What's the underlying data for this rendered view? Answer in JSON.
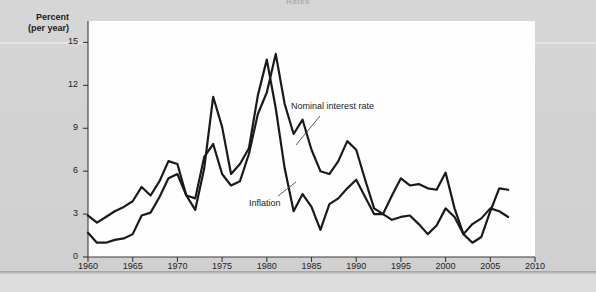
{
  "figure": {
    "top_title": "Rates",
    "axis_title_line1": "Percent",
    "axis_title_line2": "(per year)"
  },
  "axes": {
    "y_ticks": [
      "0",
      "3",
      "6",
      "9",
      "12",
      "15"
    ],
    "x_ticks": [
      "1960",
      "1965",
      "1970",
      "1975",
      "1980",
      "1985",
      "1990",
      "1995",
      "2000",
      "2005",
      "2010"
    ]
  },
  "annotations": {
    "nominal_label": "Nominal interest rate",
    "inflation_label": "Inflation"
  },
  "colors": {
    "line": "#1a1a1a",
    "plot_background": "#fefefe",
    "page_background": "#d4d4d4",
    "text": "#222222"
  },
  "chart_data": {
    "type": "line",
    "title": "Rates",
    "xlabel": "",
    "ylabel": "Percent (per year)",
    "xlim": [
      1960,
      2010
    ],
    "ylim": [
      0,
      16.5
    ],
    "grid": false,
    "legend": "annotated-inline",
    "x": [
      1960,
      1961,
      1962,
      1963,
      1964,
      1965,
      1966,
      1967,
      1968,
      1969,
      1970,
      1971,
      1972,
      1973,
      1974,
      1975,
      1976,
      1977,
      1978,
      1979,
      1980,
      1981,
      1982,
      1983,
      1984,
      1985,
      1986,
      1987,
      1988,
      1989,
      1990,
      1991,
      1992,
      1993,
      1994,
      1995,
      1996,
      1997,
      1998,
      1999,
      2000,
      2001,
      2002,
      2003,
      2004,
      2005,
      2006,
      2007
    ],
    "series": [
      {
        "name": "Nominal interest rate",
        "values": [
          2.9,
          2.4,
          2.8,
          3.2,
          3.5,
          3.9,
          4.9,
          4.3,
          5.3,
          6.7,
          6.5,
          4.3,
          4.1,
          7.0,
          7.9,
          5.8,
          5.0,
          5.3,
          7.2,
          10.0,
          11.5,
          14.2,
          10.7,
          8.6,
          9.6,
          7.5,
          6.0,
          5.8,
          6.7,
          8.1,
          7.5,
          5.4,
          3.4,
          3.0,
          4.3,
          5.5,
          5.0,
          5.1,
          4.8,
          4.7,
          5.9,
          3.4,
          1.6,
          1.0,
          1.4,
          3.2,
          4.8,
          4.7
        ],
        "color": "#1a1a1a"
      },
      {
        "name": "Inflation",
        "values": [
          1.7,
          1.0,
          1.0,
          1.2,
          1.3,
          1.6,
          2.9,
          3.1,
          4.2,
          5.5,
          5.8,
          4.3,
          3.3,
          6.2,
          11.2,
          9.1,
          5.8,
          6.5,
          7.6,
          11.3,
          13.8,
          10.4,
          6.2,
          3.2,
          4.4,
          3.5,
          1.9,
          3.7,
          4.1,
          4.8,
          5.4,
          4.2,
          3.0,
          3.0,
          2.6,
          2.8,
          2.9,
          2.3,
          1.6,
          2.2,
          3.4,
          2.8,
          1.6,
          2.3,
          2.7,
          3.4,
          3.2,
          2.8
        ],
        "color": "#1a1a1a"
      }
    ]
  }
}
